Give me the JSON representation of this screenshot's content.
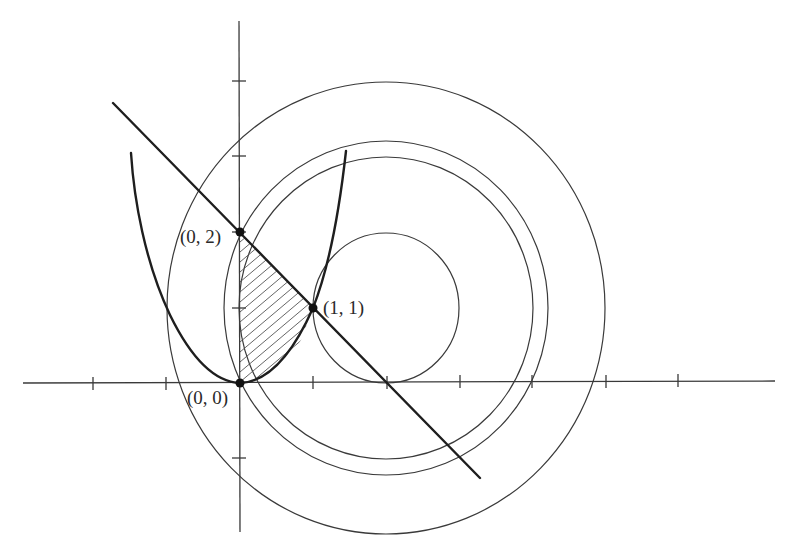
{
  "diagram": {
    "colors": {
      "background": "#ffffff",
      "curves": "#1e1e1e",
      "thin_lines": "#3a3a3a",
      "hatch": "#555555",
      "label_text": "#2a2a2a"
    },
    "coordinate_system": {
      "origin_px": [
        240,
        383
      ],
      "x_unit_px": 73,
      "y_unit_px": 75,
      "x_ticks": [
        -2,
        -1,
        1,
        2,
        3,
        4,
        5,
        6
      ],
      "y_ticks": [
        -1,
        1,
        2,
        3,
        4
      ]
    },
    "curves": [
      {
        "name": "parabola",
        "equation": "y = x^2"
      },
      {
        "name": "line",
        "equation": "y = -x + 2"
      }
    ],
    "circles": [
      {
        "center": [
          2,
          1
        ],
        "radius": "1"
      },
      {
        "center": [
          2,
          1
        ],
        "radius": "2"
      },
      {
        "center": [
          2,
          1
        ],
        "radius": "√5"
      },
      {
        "center": [
          2,
          1
        ],
        "radius": "3"
      }
    ],
    "points": [
      {
        "label": "(0, 2)",
        "x": 0,
        "y": 2
      },
      {
        "label": "(1, 1)",
        "x": 1,
        "y": 1
      },
      {
        "label": "(0, 0)",
        "x": 0,
        "y": 0
      }
    ],
    "shaded_region": "between x = 0, y = x^2 and y = -x + 2, for 0 ≤ x ≤ 1"
  }
}
